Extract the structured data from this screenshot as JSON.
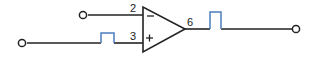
{
  "diagram": {
    "canvas": {
      "width": 317,
      "height": 60,
      "background": "#ffffff"
    },
    "colors": {
      "wire": "#222222",
      "hop_marker": "#4a7ebb",
      "label": "#1a1a1a",
      "background": "#ffffff"
    },
    "component": {
      "type": "operational-amplifier",
      "shape": "triangle",
      "inverting_input_symbol": "−",
      "noninverting_input_symbol": "+"
    },
    "pins": [
      {
        "number": "2",
        "role": "inverting-input",
        "x": 133,
        "y": 12
      },
      {
        "number": "3",
        "role": "noninverting-input",
        "x": 133,
        "y": 40
      },
      {
        "number": "6",
        "role": "output",
        "x": 190,
        "y": 26
      }
    ],
    "terminals": [
      {
        "name": "inverting-input-terminal",
        "x": 83,
        "y": 15
      },
      {
        "name": "noninverting-input-terminal",
        "x": 22,
        "y": 43
      },
      {
        "name": "output-terminal",
        "x": 296,
        "y": 29
      }
    ],
    "hop_markers": [
      {
        "name": "input-wire-hop",
        "x": 101,
        "y": 33,
        "width": 13,
        "height": 10
      },
      {
        "name": "output-wire-hop",
        "x": 210,
        "y": 12,
        "width": 11,
        "height": 17
      }
    ]
  }
}
